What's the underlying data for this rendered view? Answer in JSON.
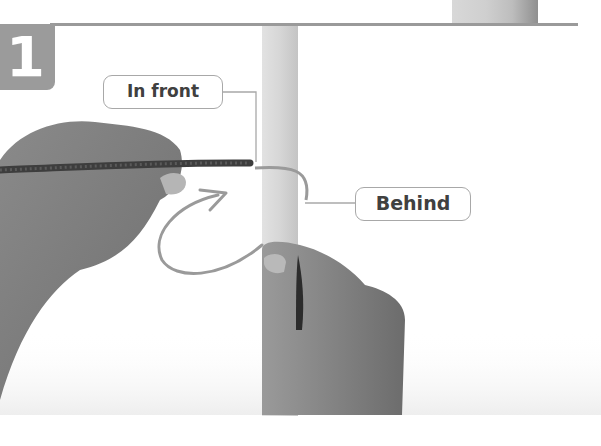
{
  "step": {
    "number": "1",
    "badge_color": "#9b9b9b"
  },
  "callouts": [
    {
      "label": "In front"
    },
    {
      "label": "Behind"
    }
  ],
  "illustration": {
    "subject": "hands wrapping a braided cord around a wooden dowel",
    "arrow_color": "#9a9a9a",
    "rule_color": "#9a9a9a"
  }
}
